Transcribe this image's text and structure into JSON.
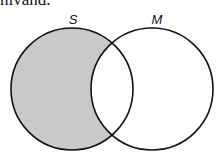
{
  "top_text": "nivand.",
  "diagram": {
    "type": "venn",
    "sets": [
      {
        "label": "S",
        "cx": 72,
        "cy": 89,
        "r": 61,
        "shaded_region": "S only (outside M)"
      },
      {
        "label": "M",
        "cx": 152,
        "cy": 89,
        "r": 61,
        "shaded_region": "none"
      }
    ],
    "shade_color": "#c9c9c9",
    "stroke_color": "#111111"
  }
}
